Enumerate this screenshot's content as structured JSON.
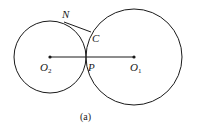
{
  "diagram": {
    "stroke_color": "#1a1a1a",
    "small_circle": {
      "center_label": "O",
      "center_sub": "2",
      "cx": 50,
      "cy": 57,
      "r": 36
    },
    "large_circle": {
      "center_label": "O",
      "center_sub": "1",
      "cx": 134,
      "cy": 57,
      "r": 48
    },
    "points": {
      "N": "N",
      "C": "C",
      "P": "P"
    },
    "segments": [
      {
        "name": "O2-O1",
        "from": [
          50,
          57
        ],
        "to": [
          134,
          57
        ]
      },
      {
        "name": "N-C",
        "from": [
          64,
          22
        ],
        "to": [
          91,
          32
        ]
      }
    ],
    "caption": "(a)"
  }
}
